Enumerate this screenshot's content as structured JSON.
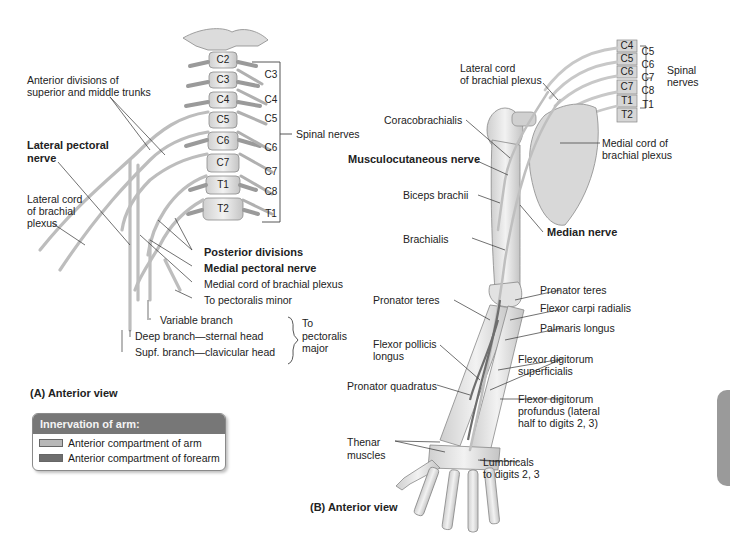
{
  "panel_a": {
    "caption": "(A) Anterior view",
    "vertebrae": [
      "C2",
      "C3",
      "C4",
      "C5",
      "C6",
      "C7",
      "T1",
      "T2"
    ],
    "right_nerve_roots": [
      "C3",
      "C4",
      "C5",
      "C6",
      "C7",
      "C8",
      "T1"
    ],
    "labels": {
      "anterior_divisions_1": "Anterior divisions of",
      "anterior_divisions_2": "superior and middle trunks",
      "lateral_pectoral_1": "Lateral pectoral",
      "lateral_pectoral_2": "nerve",
      "lateral_cord_1": "Lateral cord",
      "lateral_cord_2": "of brachial",
      "lateral_cord_3": "plexus",
      "spinal_nerves": "Spinal nerves",
      "posterior_divisions": "Posterior divisions",
      "medial_pectoral": "Medial pectoral nerve",
      "medial_cord": "Medial cord of brachial plexus",
      "to_pectoralis_minor": "To pectoralis minor",
      "variable_branch": "Variable branch",
      "deep_branch": "Deep branch—sternal head",
      "supf_branch": "Supf. branch—clavicular head",
      "to_pm_1": "To",
      "to_pm_2": "pectoralis",
      "to_pm_3": "major"
    }
  },
  "legend": {
    "title": "Innervation of arm:",
    "items": [
      {
        "label": "Anterior compartment of arm",
        "color": "#b8b8b8"
      },
      {
        "label": "Anterior compartment of forearm",
        "color": "#6e6e6e"
      }
    ]
  },
  "panel_b": {
    "caption": "(B) Anterior view",
    "vertebrae": [
      "C4",
      "C5",
      "C6",
      "C7",
      "T1",
      "T2"
    ],
    "nerve_roots": [
      "C5",
      "C6",
      "C7",
      "C8",
      "T1"
    ],
    "labels": {
      "lateral_cord_1": "Lateral cord",
      "lateral_cord_2": "of brachial plexus",
      "spinal_nerves_1": "Spinal",
      "spinal_nerves_2": "nerves",
      "coracobrachialis": "Coracobrachialis",
      "musculocutaneous": "Musculocutaneous nerve",
      "medial_cord_1": "Medial cord of",
      "medial_cord_2": "brachial plexus",
      "biceps": "Biceps brachii",
      "brachialis": "Brachialis",
      "median_nerve": "Median nerve",
      "pronator_teres_right": "Pronator teres",
      "pronator_teres_left": "Pronator teres",
      "flexor_carpi_radialis": "Flexor carpi radialis",
      "palmaris_longus": "Palmaris longus",
      "fpl_1": "Flexor pollicis",
      "fpl_2": "longus",
      "fds_1": "Flexor digitorum",
      "fds_2": "superficialis",
      "pronator_quadratus": "Pronator quadratus",
      "fdp_1": "Flexor digitorum",
      "fdp_2": "profundus (lateral",
      "fdp_3": "half to digits 2, 3)",
      "thenar_1": "Thenar",
      "thenar_2": "muscles",
      "lumbricals_1": "Lumbricals",
      "lumbricals_2": "to digits 2, 3"
    }
  }
}
